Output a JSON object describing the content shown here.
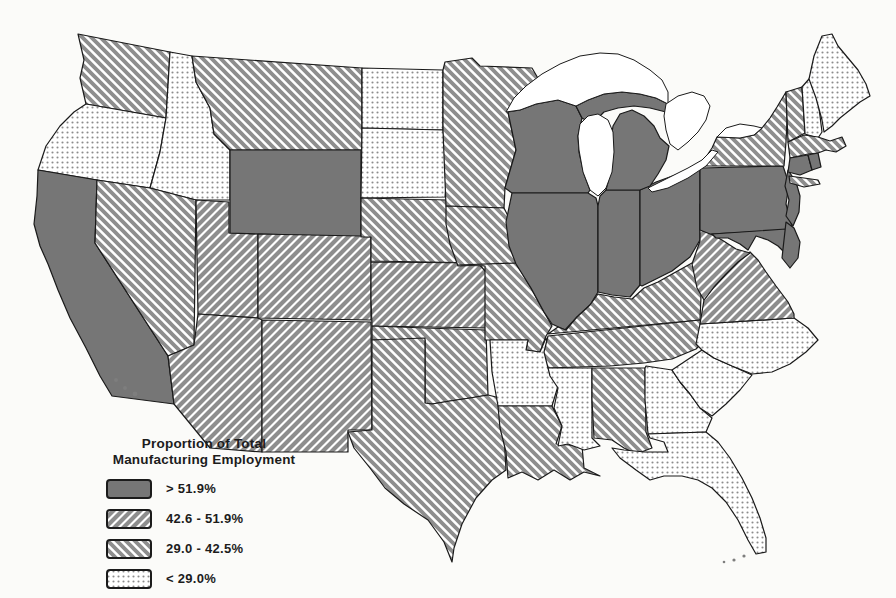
{
  "legend": {
    "title1": "Proportion of Total",
    "title2": "Manufacturing Employment"
  },
  "colors": {
    "solid_fill": "#767676",
    "hatch_gray": "#8e8e8e",
    "dot_gray": "#8c8c8c",
    "outline": "#1a1a1a",
    "water": "#ffffff",
    "background": "#fbfbf9"
  },
  "chart_data": {
    "type": "choropleth",
    "region": "United States (contiguous 48 states)",
    "title": "Proportion of Total Manufacturing Employment",
    "legend_position": "bottom-left",
    "classes": [
      {
        "key": "c1",
        "label": "> 51.9%",
        "pattern": "solid-gray",
        "states": [
          "CA",
          "WY",
          "WI",
          "MI",
          "IL",
          "IN",
          "OH",
          "PA",
          "NJ",
          "DE",
          "MD",
          "CT",
          "RI"
        ]
      },
      {
        "key": "c2",
        "label": "42.6 - 51.9%",
        "pattern": "diagonal-hatch-up",
        "states": [
          "AZ",
          "UT",
          "CO",
          "NM",
          "KS",
          "WV",
          "VA"
        ]
      },
      {
        "key": "c3",
        "label": "29.0 - 42.5%",
        "pattern": "diagonal-hatch-down",
        "states": [
          "WA",
          "MT",
          "NV",
          "NE",
          "OK",
          "TX",
          "MN",
          "IA",
          "MO",
          "LA",
          "KY",
          "TN",
          "AL",
          "NY",
          "VT",
          "MA"
        ]
      },
      {
        "key": "c4",
        "label": "< 29.0%",
        "pattern": "dot-stipple",
        "states": [
          "OR",
          "ID",
          "ND",
          "SD",
          "AR",
          "MS",
          "NC",
          "SC",
          "GA",
          "FL",
          "ME",
          "NH"
        ]
      }
    ]
  }
}
